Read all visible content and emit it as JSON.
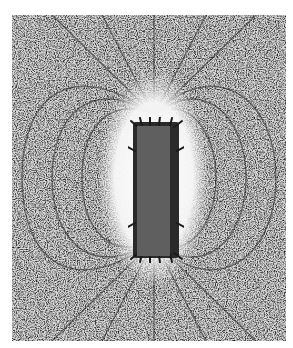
{
  "image": {
    "subject": "Iron filings aligned along the magnetic field lines of a bar magnet",
    "colors": {
      "border": "#ffffff",
      "filings_dark": "#1e1e1e",
      "filings_mid": "#7a7a7a",
      "background_light": "#e8e8e8",
      "clear_zone": "#f6f6f6",
      "magnet": "#5f5f5f"
    },
    "magnet": {
      "x": 137,
      "y": 126,
      "width": 33,
      "height": 130
    }
  }
}
